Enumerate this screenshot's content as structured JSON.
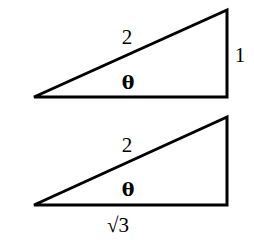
{
  "diagram": {
    "title": "",
    "stroke_color": "#000000",
    "background": "#ffffff",
    "triangles": [
      {
        "id": "top",
        "hypotenuse_label": "2",
        "opposite_label": "1",
        "adjacent_label": "",
        "angle_label": "θ"
      },
      {
        "id": "bottom",
        "hypotenuse_label": "2",
        "opposite_label": "",
        "adjacent_label": "√3",
        "angle_label": "θ"
      }
    ]
  }
}
